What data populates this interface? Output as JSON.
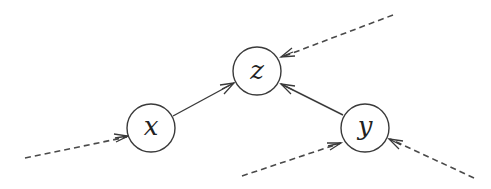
{
  "diagram": {
    "type": "directed-graph",
    "nodes": [
      {
        "id": "z",
        "label": "z",
        "cx": 257,
        "cy": 71,
        "r": 24
      },
      {
        "id": "x",
        "label": "x",
        "cx": 151,
        "cy": 128,
        "r": 24
      },
      {
        "id": "y",
        "label": "y",
        "cx": 365,
        "cy": 128,
        "r": 24
      }
    ],
    "edges": [
      {
        "from": "x",
        "to": "z",
        "style": "solid"
      },
      {
        "from": "y",
        "to": "z",
        "style": "solid"
      },
      {
        "from": "external",
        "to": "x",
        "style": "dashed"
      },
      {
        "from": "external",
        "to": "z",
        "style": "dashed"
      },
      {
        "from": "external",
        "to": "y",
        "style": "dashed"
      },
      {
        "from": "external",
        "to": "y",
        "style": "dashed"
      }
    ],
    "colors": {
      "stroke": "#3a3a3a",
      "text": "#222222",
      "background": "#ffffff"
    }
  }
}
